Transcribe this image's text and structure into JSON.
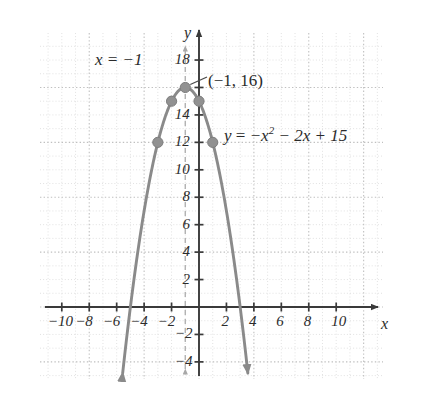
{
  "chart_data": {
    "type": "line",
    "title": "",
    "subtitle": "",
    "xlabel": "x",
    "ylabel": "y",
    "xlim": [
      -11.6,
      11.8
    ],
    "ylim": [
      -5.4,
      19.8
    ],
    "grid": true,
    "grid_minor_step": 1,
    "grid_major_step": 4,
    "legend": "none",
    "equation": "y = −x² − 2x + 15",
    "vertex": {
      "x": -1,
      "y": 16,
      "label": "(−1, 16)"
    },
    "axis_of_symmetry": {
      "x": -1,
      "label": "x = −1",
      "style": "dashed"
    },
    "x_ticks": [
      -10,
      -8,
      -6,
      -4,
      -2,
      2,
      4,
      6,
      8,
      10
    ],
    "x_tick_labels": [
      "−10",
      "−8",
      "−6",
      "−4",
      "−2",
      "2",
      "4",
      "6",
      "8",
      "10"
    ],
    "y_ticks": [
      -4,
      -2,
      2,
      4,
      6,
      8,
      10,
      12,
      14,
      16,
      18
    ],
    "y_tick_labels": [
      "−4",
      "−2",
      "2",
      "4",
      "6",
      "8",
      "10",
      "12",
      "14",
      "",
      "18"
    ],
    "y_unlabeled_ticks": [
      16
    ],
    "series": [
      {
        "name": "y = −x² − 2x + 15",
        "type": "parabola",
        "color": "#8a8a8a",
        "a": -1,
        "b": -2,
        "c": 15,
        "arrowheads": [
          "left-end",
          "right-end"
        ],
        "points": [
          {
            "x": -5,
            "y": 0
          },
          {
            "x": -3,
            "y": 12
          },
          {
            "x": -2,
            "y": 15
          },
          {
            "x": -1,
            "y": 16
          },
          {
            "x": 0,
            "y": 15
          },
          {
            "x": 1,
            "y": 12
          },
          {
            "x": 3,
            "y": 0
          }
        ],
        "marked_points": [
          {
            "x": -3,
            "y": 12
          },
          {
            "x": -2,
            "y": 15
          },
          {
            "x": -1,
            "y": 16
          },
          {
            "x": 0,
            "y": 15
          },
          {
            "x": 1,
            "y": 12
          }
        ]
      }
    ]
  },
  "labels": {
    "symmetry": "x = −1",
    "vertex_point": "(−1, 16)",
    "equation_y": "y",
    "equation_eq": "=",
    "equation_neg_x": "−x",
    "equation_exp": "2",
    "equation_rest": "− 2x + 15",
    "axis_x": "x",
    "axis_y": "y"
  },
  "colors": {
    "curve": "#8a8a8a",
    "point_fill": "#909090",
    "axis": "#3a3a3a",
    "grid_minor": "#d8d8d8",
    "grid_major": "#bdbdbd",
    "text": "#2b2b2b",
    "symmetry_line": "#b0b0b0",
    "background": "#ffffff"
  }
}
